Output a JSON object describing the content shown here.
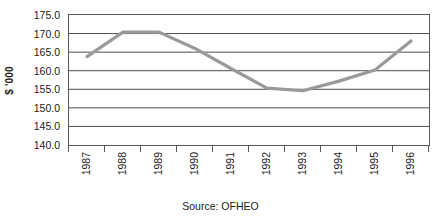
{
  "chart_data": {
    "type": "line",
    "title": "",
    "subtitle": "",
    "xlabel": "",
    "ylabel": "$ '000",
    "source_note": "Source: OFHEO",
    "categories": [
      "1987",
      "1988",
      "1989",
      "1990",
      "1991",
      "1992",
      "1993",
      "1994",
      "1995",
      "1996"
    ],
    "x_tick_labels": [
      "1987",
      "1988",
      "1989",
      "1990",
      "1991",
      "1992",
      "1993",
      "1994",
      "1995",
      "1996"
    ],
    "y_tick_labels": [
      "175.0",
      "170.0",
      "165.0",
      "160.0",
      "155.0",
      "150.0",
      "145.0",
      "140.0"
    ],
    "y_tick_values": [
      175.0,
      170.0,
      165.0,
      160.0,
      155.0,
      150.0,
      145.0,
      140.0
    ],
    "ylim": [
      140.0,
      175.0
    ],
    "grid": "horizontal",
    "legend": "none",
    "series": [
      {
        "name": "Average home price",
        "color": "#9a9a9a",
        "values": [
          163.8,
          170.4,
          170.4,
          166.0,
          160.6,
          155.3,
          154.6,
          157.2,
          160.2,
          168.0
        ]
      }
    ]
  },
  "axis": {
    "y_title": "$ '000"
  },
  "caption": {
    "source": "Source: OFHEO"
  },
  "colors": {
    "line": "#9a9a9a",
    "grid": "#4d4d4d",
    "frame": "#5a5a5a",
    "background": "#ffffff"
  }
}
